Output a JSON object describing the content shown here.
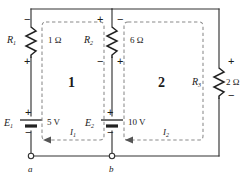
{
  "diagram": {
    "wire_color": "#333333",
    "dash_color": "#8a8a8a",
    "text_color": "#1a1a1a"
  },
  "components": {
    "r1": {
      "name": "R",
      "subscript": "1",
      "value": "1 Ω",
      "polarity_top": "−",
      "polarity_bottom": "+"
    },
    "r2": {
      "name": "R",
      "subscript": "2",
      "value": "6 Ω",
      "polarity_top_left": "+",
      "polarity_bottom_left": "−",
      "polarity_top_right": "−",
      "polarity_bottom_right": "+"
    },
    "r3": {
      "name": "R",
      "subscript": "3",
      "value": "2 Ω",
      "polarity_top": "+",
      "polarity_bottom": "−"
    },
    "e1": {
      "name": "E",
      "subscript": "1",
      "value": "5 V",
      "polarity_top": "+",
      "polarity_bottom": "−"
    },
    "e2": {
      "name": "E",
      "subscript": "2",
      "value": "10 V",
      "polarity_top": "+",
      "polarity_bottom": "−"
    }
  },
  "loops": [
    {
      "label": "1",
      "current_name": "I",
      "current_subscript": "1"
    },
    {
      "label": "2",
      "current_name": "I",
      "current_subscript": "2"
    }
  ],
  "nodes": [
    {
      "label": "a"
    },
    {
      "label": "b"
    }
  ]
}
